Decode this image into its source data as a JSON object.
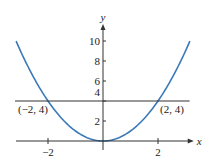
{
  "chart_data": {
    "type": "line",
    "title": "",
    "xlabel": "x",
    "ylabel": "y",
    "xlim": [
      -3.2,
      3.3
    ],
    "ylim": [
      -0.5,
      11.5
    ],
    "grid": false,
    "x_ticks": [
      -2,
      2
    ],
    "x_tick_labels": [
      "−2",
      "2"
    ],
    "y_ticks": [
      2,
      4,
      6,
      8,
      10
    ],
    "y_tick_labels": [
      "2",
      "4",
      "6",
      "8",
      "10"
    ],
    "series": [
      {
        "name": "y = x^2",
        "kind": "function",
        "expression": "x^2",
        "domain": [
          -3.16,
          3.16
        ],
        "color": "#3a79b8"
      },
      {
        "name": "y = 4",
        "kind": "horizontal-line",
        "value": 4,
        "domain": [
          -3.2,
          3.15
        ],
        "color": "#333333"
      }
    ],
    "annotations": [
      {
        "text": "(−2, 4)",
        "x": -2,
        "y": 4,
        "anchor": "below-left"
      },
      {
        "text": "(2, 4)",
        "x": 2,
        "y": 4,
        "anchor": "below-right"
      }
    ]
  }
}
